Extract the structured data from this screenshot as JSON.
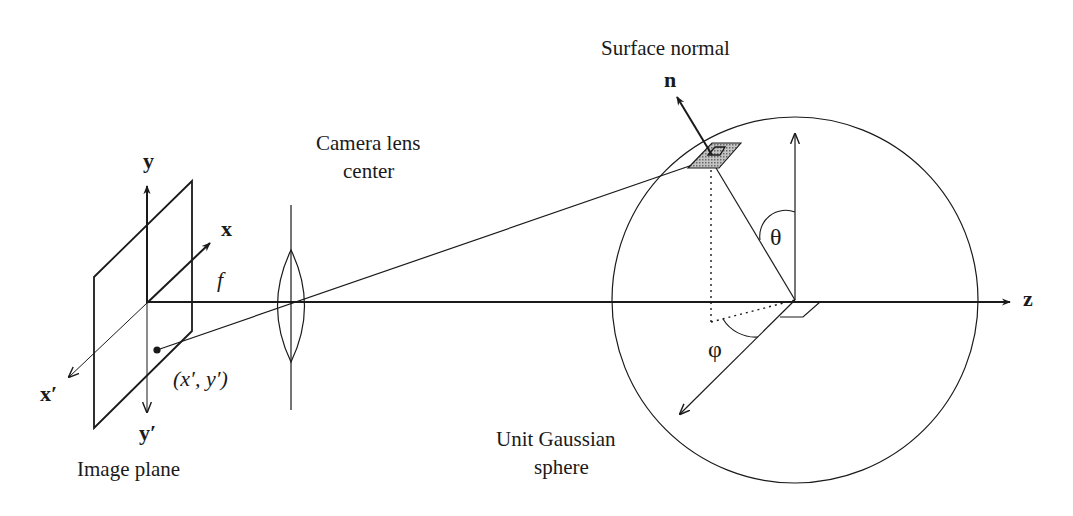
{
  "figure": {
    "labels": {
      "surface_normal": "Surface normal",
      "normal_vector": "n",
      "camera_lens_line1": "Camera lens",
      "camera_lens_line2": "center",
      "image_plane": "Image plane",
      "unit_sphere_line1": "Unit Gaussian",
      "unit_sphere_line2": "sphere",
      "axis_x": "x",
      "axis_y": "y",
      "axis_z": "z",
      "axis_x_prime": "x′",
      "axis_y_prime": "y′",
      "focal_length": "f",
      "image_point": "(x′, y′)",
      "polar_angle": "θ",
      "azimuth_angle": "φ"
    },
    "colors": {
      "line": "#1a1a1a",
      "patch_fill": "#a8a8a8",
      "background": "#ffffff"
    }
  }
}
